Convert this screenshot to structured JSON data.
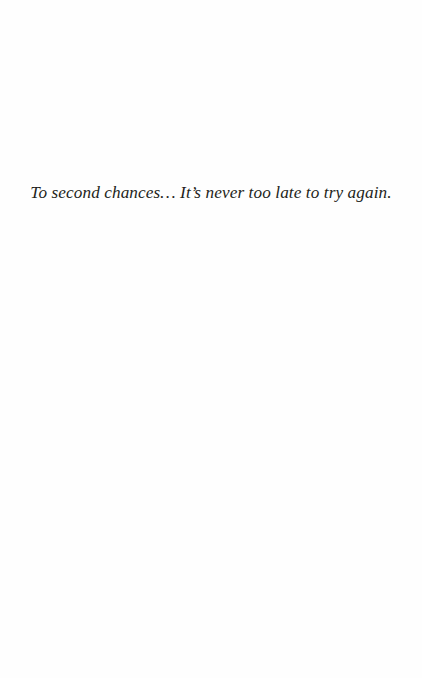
{
  "page": {
    "type": "dedication",
    "background_color": "#ffffff",
    "text_color": "#231f20",
    "dedication_text": "To second chances… It’s never too late to try again."
  }
}
